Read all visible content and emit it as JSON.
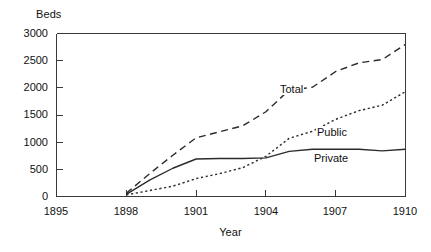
{
  "chart_data": {
    "type": "line",
    "title": "",
    "xlabel": "Year",
    "ylabel": "Beds",
    "xlim": [
      1895,
      1910
    ],
    "ylim": [
      0,
      3000
    ],
    "xticks": [
      1895,
      1898,
      1901,
      1904,
      1907,
      1910
    ],
    "yticks": [
      0,
      500,
      1000,
      1500,
      2000,
      2500,
      3000
    ],
    "xtick_labels": [
      "1895",
      "1898",
      "1901",
      "1904",
      "1907",
      "1910"
    ],
    "ytick_labels": [
      "0",
      "500",
      "1000",
      "1500",
      "2000",
      "2500",
      "3000"
    ],
    "grid": false,
    "legend_position": "inline-annotations",
    "x": [
      1898,
      1899,
      1900,
      1901,
      1902,
      1903,
      1904,
      1905,
      1906,
      1907,
      1908,
      1909,
      1910
    ],
    "series": [
      {
        "name": "Total",
        "style": "dashed",
        "values": [
          60,
          420,
          760,
          1080,
          1190,
          1300,
          1560,
          1960,
          2010,
          2300,
          2460,
          2520,
          2800
        ]
      },
      {
        "name": "Public",
        "style": "dotted",
        "values": [
          30,
          110,
          190,
          330,
          420,
          530,
          740,
          1070,
          1200,
          1420,
          1580,
          1680,
          1930
        ]
      },
      {
        "name": "Private",
        "style": "solid",
        "values": [
          40,
          300,
          520,
          690,
          700,
          700,
          710,
          830,
          870,
          870,
          870,
          840,
          870
        ]
      }
    ],
    "annotations": [
      {
        "text": "Total",
        "x": 1905.0,
        "y": 1700
      },
      {
        "text": "Public",
        "x": 1906.6,
        "y": 920
      },
      {
        "text": "Private",
        "x": 1906.5,
        "y": 430
      }
    ],
    "colors": {
      "line": "#2b2b2b",
      "axis": "#3a3a3a",
      "background": "#ffffff",
      "text": "#111111"
    }
  }
}
